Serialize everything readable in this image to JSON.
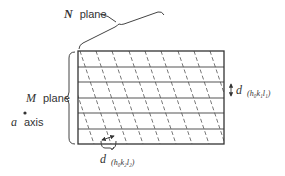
{
  "diagram": {
    "labels": {
      "n_plane_symbol": "N",
      "n_plane_word": "plane",
      "m_plane_symbol": "M",
      "m_plane_word": "plane",
      "axis_symbol": "a",
      "axis_word": "axis",
      "d1_main": "d",
      "d1_sub": "(h₀k₁l₁)",
      "d2_main": "d",
      "d2_sub": "(h₀k₂l₂)"
    },
    "rectangle": {
      "x": 78,
      "y": 51,
      "width": 146,
      "height": 93
    },
    "m_plane_lines_count": 7,
    "n_plane_lines_slope_dx_per_dy": 0.33,
    "colors": {
      "line": "#333333",
      "background": "#ffffff"
    }
  }
}
